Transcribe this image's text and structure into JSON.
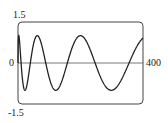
{
  "chart_data": {
    "type": "line",
    "title": "",
    "xlabel": "",
    "ylabel": "",
    "function": "y = sin(sqrt(x))",
    "xlim": [
      0,
      400
    ],
    "ylim": [
      -1.5,
      1.5
    ],
    "grid": false,
    "x_tick_labels": [
      "0",
      "400"
    ],
    "y_tick_labels": [
      "1.5",
      "-1.5"
    ],
    "series": [
      {
        "name": "y",
        "x": [
          0,
          2,
          5,
          10,
          15,
          22,
          30,
          40,
          50,
          64,
          80,
          100,
          125,
          150,
          175,
          202,
          230,
          260,
          301,
          330,
          360,
          400
        ],
        "values": [
          0.0,
          0.99,
          0.79,
          -0.02,
          -0.67,
          -1.0,
          -0.74,
          0.04,
          0.66,
          0.99,
          0.59,
          -0.54,
          -0.98,
          -0.63,
          0.31,
          0.96,
          0.8,
          0.3,
          -0.99,
          -0.48,
          0.28,
          0.91
        ]
      }
    ]
  },
  "labels": {
    "y_top": "1.5",
    "y_zero": "0",
    "y_bottom": "-1.5",
    "x_right": "400"
  },
  "colors": {
    "curve": "#222222",
    "frame": "#444444",
    "axis": "#555555"
  }
}
